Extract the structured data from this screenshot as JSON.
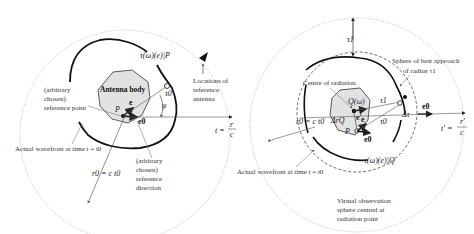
{
  "left_panel": {
    "antenna_body": "Antenna body",
    "pattern_label": "τ(ω)(e)|P",
    "reference_point": [
      "(arbitrary",
      "chosen)",
      "reference point"
    ],
    "reference_antenna": [
      "Locations of",
      "reference",
      "antenna"
    ],
    "actual_wavefront": "Actual wavefront at time  t = t0",
    "radius_label": "r0 = c t0",
    "reference_direction": [
      "(arbitrary",
      "chosen)",
      "reference",
      "direction"
    ],
    "t_eq": "t =",
    "t_frac_num": "r",
    "t_frac_den": "c",
    "P": "P",
    "e": "e",
    "e0": "e0",
    "tau0": "τ0",
    "phi": "φ"
  },
  "right_panel": {
    "tau1_top": "τ1",
    "sphere_best": [
      "Sphere of best approach",
      "of  radius  τ1"
    ],
    "centre_radiation": "Centre of radiation",
    "Q": "Q(ω)",
    "e_prime": "e'",
    "delta_r": "ΔrQ",
    "e": "e",
    "P": "P",
    "e0": "e0",
    "tau1": "τ1",
    "tau0": "τ0",
    "delta_tau": "Δτ",
    "e0_arrow": "e0",
    "radius_label": "r0 = c t0",
    "t_prime": "t' =",
    "t_frac_num": "r'",
    "t_frac_den": "c",
    "actual_wavefront": "Actual wavefront at time   t = t0",
    "pattern_label": "τ(ω)(e)|Q",
    "virtual_sphere": [
      "Virtual observation",
      "sphere centred at",
      "radiation point"
    ]
  }
}
